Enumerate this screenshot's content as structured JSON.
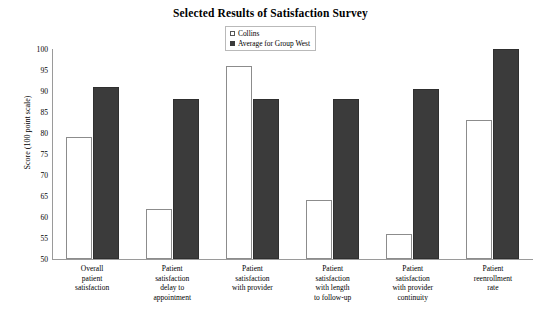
{
  "chart_data": {
    "type": "bar",
    "title": "Selected Results of Satisfaction Survey",
    "xlabel": "",
    "ylabel": "Score (100 point scale)",
    "ylim": [
      50,
      100
    ],
    "ytick_step": 5,
    "yticks": [
      100,
      95,
      90,
      85,
      80,
      75,
      70,
      65,
      60,
      55,
      50
    ],
    "grid": false,
    "legend_position": "top-center",
    "categories": [
      "Overall patient satisfaction",
      "Patient satisfaction delay to appointment",
      "Patient satisfaction with provider",
      "Patient satisfaction with length to follow-up",
      "Patient satisfaction with provider continuity",
      "Patient reenrollment rate"
    ],
    "category_lines": [
      [
        "Overall",
        "patient",
        "satisfaction"
      ],
      [
        "Patient",
        "satisfaction",
        "delay to",
        "appointment"
      ],
      [
        "Patient",
        "satisfaction",
        "with provider"
      ],
      [
        "Patient",
        "satisfaction",
        "with length",
        "to follow-up"
      ],
      [
        "Patient",
        "satisfaction",
        "with provider",
        "continuity"
      ],
      [
        "Patient",
        "reenrollment",
        "rate"
      ]
    ],
    "series": [
      {
        "name": "Collins",
        "color": "#ffffff",
        "swatch": "hollow",
        "values": [
          79,
          62,
          96,
          64,
          56,
          83
        ]
      },
      {
        "name": "Average for Group West",
        "color": "#3b3b3b",
        "swatch": "solid",
        "values": [
          91,
          88,
          88,
          88,
          90.5,
          100
        ]
      }
    ]
  },
  "legend": {
    "items": [
      {
        "label": "Collins"
      },
      {
        "label": "Average for Group West"
      }
    ]
  }
}
